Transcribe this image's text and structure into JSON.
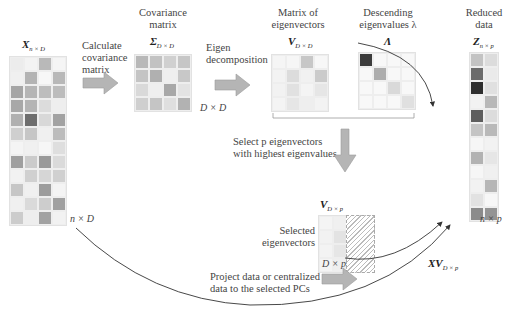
{
  "labels": {
    "x_matrix": {
      "main": "X",
      "sub": "n × D"
    },
    "calc_cov": "Calculate\ncovariance\nmatrix",
    "cov_title": "Covariance\nmatrix",
    "sigma": {
      "main": "Σ",
      "sub": "D × D"
    },
    "dd_dim": "D × D",
    "eigen_decomp": "Eigen\ndecomposition",
    "eigvec_title": "Matrix of\neigenvectors",
    "v_matrix": {
      "main": "V",
      "sub": "D × D"
    },
    "desc_title": "Descending\neigenvalues λ",
    "lambda": "Λ",
    "reduced_title": "Reduced\ndata",
    "z_matrix": {
      "main": "Z",
      "sub": "n × p"
    },
    "select_text": "Select p eigenvectors\nwith highest eigenvalues",
    "vp_matrix": {
      "main": "V",
      "sub": "D × p"
    },
    "selected_label": "Selected\neigenvectors",
    "dp_dim": "D × p",
    "nd_dim": "n × D",
    "np_dim": "n × p",
    "xv": {
      "main": "XV",
      "sub": "D × p"
    },
    "project_text": "Project data or centralized\ndata to the selected PCs"
  },
  "matrices": {
    "x": {
      "cols": 4,
      "cells": [
        "#ececec",
        "#f3f3f3",
        "#b9b9b9",
        "#f5f5f5",
        "#f0f0f0",
        "#b3b3b3",
        "#f7f7f7",
        "#b8b8b8",
        "#a5a5a5",
        "#b5b5b5",
        "#bdbdbd",
        "#bcbcbc",
        "#a8a8a8",
        "#b4b4b4",
        "#dcdcdc",
        "#eeeeee",
        "#b0b0b0",
        "#6e6e6e",
        "#d8d8d8",
        "#a2a2a2",
        "#cfcfcf",
        "#c6c6c6",
        "#f0f0f0",
        "#bcbcbc",
        "#f4f4f4",
        "#f0f0f0",
        "#f6f6f6",
        "#dedede",
        "#9f9f9f",
        "#cbcbcb",
        "#999999",
        "#dadada",
        "#f2f2f2",
        "#d0d0d0",
        "#d6d6d6",
        "#d0d0d0",
        "#c6c6c6",
        "#f0f0f0",
        "#9c9c9c",
        "#f4f4f4",
        "#f0f0f0",
        "#dadada",
        "#cdcdcd",
        "#a0a0a0",
        "#cccccc",
        "#eeeeee",
        "#a2a2a2",
        "#f2f2f2"
      ]
    },
    "sigma": {
      "cols": 4,
      "cells": [
        "#b8b8b8",
        "#c2c2c2",
        "#d0d0d0",
        "#c6c6c6",
        "#c4c4c4",
        "#b0b0b0",
        "#efefef",
        "#c8c8c8",
        "#d9d9d9",
        "#efefef",
        "#a8a8a8",
        "#e3e3e3",
        "#cfcfcf",
        "#c5c5c5",
        "#dfdfdf",
        "#b2b2b2"
      ]
    },
    "v": {
      "cols": 4,
      "cells": [
        "#f5f5f5",
        "#f6f6f6",
        "#c7c7c7",
        "#f7f7f7",
        "#f3f3f3",
        "#dcdcdc",
        "#f1f1f1",
        "#cbcbcb",
        "#f2f2f2",
        "#e1e1e1",
        "#f4f4f4",
        "#e6e6e6",
        "#f4f4f4",
        "#e6e6e6",
        "#eeeeee",
        "#f3f3f3"
      ]
    },
    "lambda": {
      "cols": 4,
      "cells": [
        "#3c3c3c",
        "#f8f8f8",
        "#f8f8f8",
        "#f8f8f8",
        "#f8f8f8",
        "#adadad",
        "#f8f8f8",
        "#f8f8f8",
        "#f8f8f8",
        "#f8f8f8",
        "#d9d9d9",
        "#f8f8f8",
        "#f8f8f8",
        "#f8f8f8",
        "#f8f8f8",
        "#e0e0e0"
      ]
    },
    "z": {
      "cols": 2,
      "cells": [
        "#c3c3c3",
        "#dcdcdc",
        "#6b6b6b",
        "#eaeaea",
        "#2e2e2e",
        "#e0e0e0",
        "#f2f2f2",
        "#b8b8b8",
        "#5d5d5d",
        "#dcdcdc",
        "#c4c4c4",
        "#b9b9b9",
        "#f6f6f6",
        "#f2f2f2",
        "#b2b2b2",
        "#e6e6e6",
        "#f6f6f6",
        "#f0f0f0",
        "#f2f2f2",
        "#b6b6b6",
        "#e2e2e2",
        "#f7f7f7",
        "#8b8b8b",
        "#949494"
      ]
    },
    "vp": {
      "cols": 2,
      "cells": [
        "#f4f4f4",
        "#f0f0f0",
        "#f2f2f2",
        "#e3e3e3",
        "#f3f3f3",
        "#e6e6e6",
        "#f4f4f4",
        "#efefef"
      ]
    }
  },
  "colors": {
    "arrow_fill": "#b5b5b5",
    "arrow_stroke": "#999999",
    "curve": "#333333",
    "grid_border": "#e2e2e2"
  }
}
